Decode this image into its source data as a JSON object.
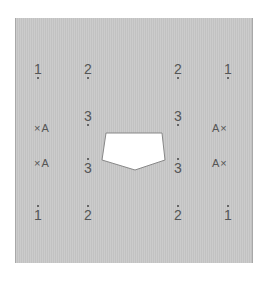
{
  "diagram": {
    "panel_color": "#c8c8c8",
    "obstacle_color": "#ffffff",
    "top_row": [
      "1",
      "2",
      "2",
      "1"
    ],
    "mid_upper_row": [
      "3",
      "3"
    ],
    "mid_lower_row": [
      "3",
      "3"
    ],
    "bottom_row": [
      "1",
      "2",
      "2",
      "1"
    ],
    "left_labels": [
      "×A",
      "×A"
    ],
    "right_labels": [
      "A×",
      "A×"
    ]
  }
}
